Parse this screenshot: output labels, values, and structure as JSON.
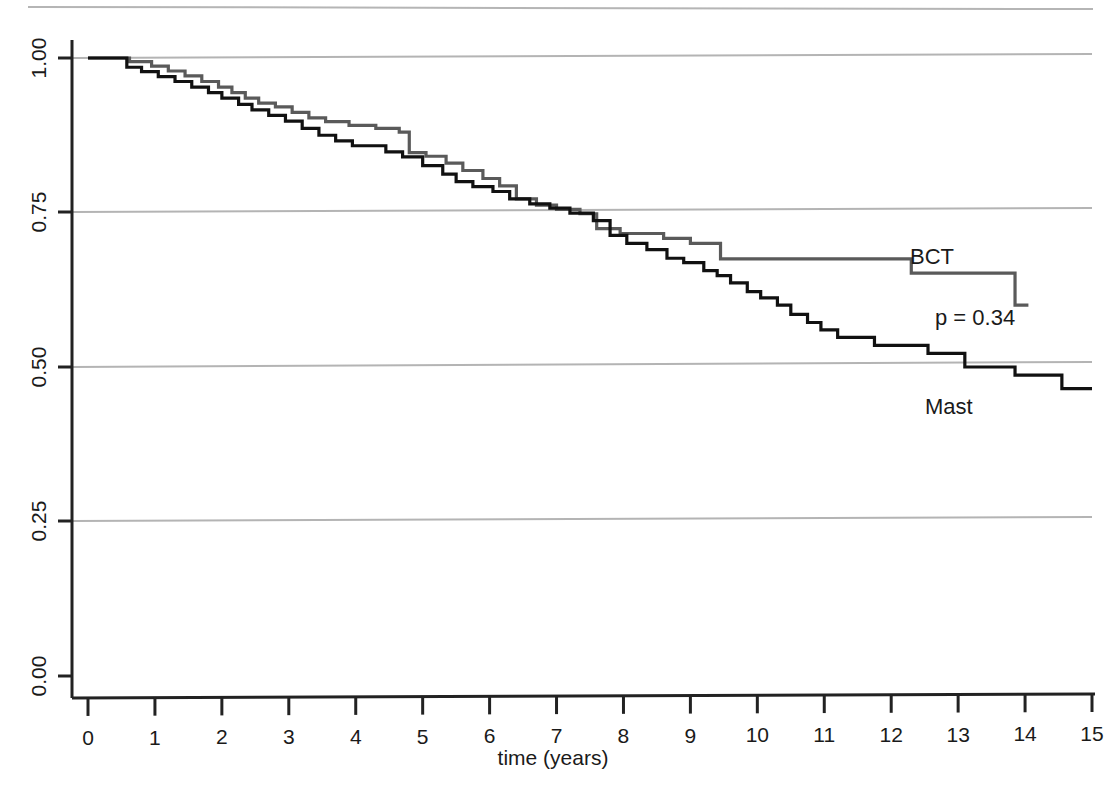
{
  "chart_data": {
    "type": "line",
    "subtype": "kaplan-meier-step",
    "title": "",
    "xlabel": "time (years)",
    "ylabel": "",
    "xlim": [
      0,
      15
    ],
    "ylim": [
      0,
      1
    ],
    "xticks": [
      0,
      1,
      2,
      3,
      4,
      5,
      6,
      7,
      8,
      9,
      10,
      11,
      12,
      13,
      14,
      15
    ],
    "xtick_labels": [
      "0",
      "1",
      "2",
      "3",
      "4",
      "5",
      "6",
      "7",
      "8",
      "9",
      "10",
      "11",
      "12",
      "13",
      "14",
      "15"
    ],
    "yticks": [
      0.0,
      0.25,
      0.5,
      0.75,
      1.0
    ],
    "ytick_labels": [
      "0.00",
      "0.25",
      "0.50",
      "0.75",
      "1.00"
    ],
    "ytick_labels_rotated": true,
    "grid": {
      "horizontal": true,
      "vertical": false,
      "color": "#b4b4b4"
    },
    "legend": {
      "position": "inline-annotations"
    },
    "annotations": [
      {
        "name": "p-value",
        "text": "p = 0.34",
        "x": 12.3,
        "y": 0.565
      },
      {
        "name": "bct-series-label",
        "text": "BCT",
        "x": 12.6,
        "y": 0.685
      },
      {
        "name": "mast-series-label",
        "text": "Mast",
        "x": 12.6,
        "y": 0.415
      }
    ],
    "series": [
      {
        "name": "BCT",
        "color": "#5a5a5a",
        "linewidth": 3.2,
        "points": [
          [
            0.0,
            1.0
          ],
          [
            0.62,
            1.0
          ],
          [
            0.62,
            0.994
          ],
          [
            0.95,
            0.994
          ],
          [
            0.95,
            0.987
          ],
          [
            1.2,
            0.987
          ],
          [
            1.2,
            0.979
          ],
          [
            1.45,
            0.979
          ],
          [
            1.45,
            0.971
          ],
          [
            1.7,
            0.971
          ],
          [
            1.7,
            0.962
          ],
          [
            1.95,
            0.962
          ],
          [
            1.95,
            0.953
          ],
          [
            2.15,
            0.953
          ],
          [
            2.15,
            0.944
          ],
          [
            2.35,
            0.944
          ],
          [
            2.35,
            0.935
          ],
          [
            2.55,
            0.935
          ],
          [
            2.55,
            0.927
          ],
          [
            2.8,
            0.927
          ],
          [
            2.8,
            0.921
          ],
          [
            3.05,
            0.921
          ],
          [
            3.05,
            0.912
          ],
          [
            3.3,
            0.912
          ],
          [
            3.3,
            0.903
          ],
          [
            3.55,
            0.903
          ],
          [
            3.55,
            0.897
          ],
          [
            3.9,
            0.897
          ],
          [
            3.9,
            0.891
          ],
          [
            4.3,
            0.891
          ],
          [
            4.3,
            0.886
          ],
          [
            4.65,
            0.886
          ],
          [
            4.65,
            0.88
          ],
          [
            4.8,
            0.88
          ],
          [
            4.8,
            0.847
          ],
          [
            5.05,
            0.847
          ],
          [
            5.05,
            0.841
          ],
          [
            5.35,
            0.841
          ],
          [
            5.35,
            0.83
          ],
          [
            5.6,
            0.83
          ],
          [
            5.6,
            0.818
          ],
          [
            5.9,
            0.818
          ],
          [
            5.9,
            0.805
          ],
          [
            6.15,
            0.805
          ],
          [
            6.15,
            0.793
          ],
          [
            6.4,
            0.793
          ],
          [
            6.4,
            0.772
          ],
          [
            6.7,
            0.772
          ],
          [
            6.7,
            0.762
          ],
          [
            7.0,
            0.762
          ],
          [
            7.0,
            0.755
          ],
          [
            7.35,
            0.755
          ],
          [
            7.35,
            0.748
          ],
          [
            7.6,
            0.748
          ],
          [
            7.6,
            0.724
          ],
          [
            7.95,
            0.724
          ],
          [
            7.95,
            0.716
          ],
          [
            8.6,
            0.716
          ],
          [
            8.6,
            0.708
          ],
          [
            9.0,
            0.708
          ],
          [
            9.0,
            0.7
          ],
          [
            9.45,
            0.7
          ],
          [
            9.45,
            0.675
          ],
          [
            12.3,
            0.675
          ],
          [
            12.3,
            0.652
          ],
          [
            13.85,
            0.652
          ],
          [
            13.85,
            0.6
          ],
          [
            14.05,
            0.6
          ]
        ]
      },
      {
        "name": "Mast",
        "color": "#111111",
        "linewidth": 3.2,
        "points": [
          [
            0.0,
            1.0
          ],
          [
            0.58,
            1.0
          ],
          [
            0.58,
            0.985
          ],
          [
            0.8,
            0.985
          ],
          [
            0.8,
            0.978
          ],
          [
            1.05,
            0.978
          ],
          [
            1.05,
            0.97
          ],
          [
            1.3,
            0.97
          ],
          [
            1.3,
            0.962
          ],
          [
            1.55,
            0.962
          ],
          [
            1.55,
            0.953
          ],
          [
            1.8,
            0.953
          ],
          [
            1.8,
            0.944
          ],
          [
            2.0,
            0.944
          ],
          [
            2.0,
            0.935
          ],
          [
            2.25,
            0.935
          ],
          [
            2.25,
            0.925
          ],
          [
            2.45,
            0.925
          ],
          [
            2.45,
            0.916
          ],
          [
            2.7,
            0.916
          ],
          [
            2.7,
            0.907
          ],
          [
            2.95,
            0.907
          ],
          [
            2.95,
            0.898
          ],
          [
            3.2,
            0.898
          ],
          [
            3.2,
            0.886
          ],
          [
            3.45,
            0.886
          ],
          [
            3.45,
            0.875
          ],
          [
            3.7,
            0.875
          ],
          [
            3.7,
            0.866
          ],
          [
            3.95,
            0.866
          ],
          [
            3.95,
            0.858
          ],
          [
            4.45,
            0.858
          ],
          [
            4.45,
            0.848
          ],
          [
            4.7,
            0.848
          ],
          [
            4.7,
            0.84
          ],
          [
            5.0,
            0.84
          ],
          [
            5.0,
            0.826
          ],
          [
            5.3,
            0.826
          ],
          [
            5.3,
            0.812
          ],
          [
            5.5,
            0.812
          ],
          [
            5.5,
            0.8
          ],
          [
            5.75,
            0.8
          ],
          [
            5.75,
            0.792
          ],
          [
            6.05,
            0.792
          ],
          [
            6.05,
            0.784
          ],
          [
            6.3,
            0.784
          ],
          [
            6.3,
            0.772
          ],
          [
            6.6,
            0.772
          ],
          [
            6.6,
            0.764
          ],
          [
            6.9,
            0.764
          ],
          [
            6.9,
            0.757
          ],
          [
            7.2,
            0.757
          ],
          [
            7.2,
            0.749
          ],
          [
            7.55,
            0.749
          ],
          [
            7.55,
            0.737
          ],
          [
            7.8,
            0.737
          ],
          [
            7.8,
            0.713
          ],
          [
            8.05,
            0.713
          ],
          [
            8.05,
            0.7
          ],
          [
            8.35,
            0.7
          ],
          [
            8.35,
            0.69
          ],
          [
            8.65,
            0.69
          ],
          [
            8.65,
            0.676
          ],
          [
            8.9,
            0.676
          ],
          [
            8.9,
            0.669
          ],
          [
            9.2,
            0.669
          ],
          [
            9.2,
            0.656
          ],
          [
            9.4,
            0.656
          ],
          [
            9.4,
            0.648
          ],
          [
            9.6,
            0.648
          ],
          [
            9.6,
            0.636
          ],
          [
            9.85,
            0.636
          ],
          [
            9.85,
            0.622
          ],
          [
            10.05,
            0.622
          ],
          [
            10.05,
            0.612
          ],
          [
            10.3,
            0.612
          ],
          [
            10.3,
            0.6
          ],
          [
            10.5,
            0.6
          ],
          [
            10.5,
            0.585
          ],
          [
            10.75,
            0.585
          ],
          [
            10.75,
            0.572
          ],
          [
            10.95,
            0.572
          ],
          [
            10.95,
            0.56
          ],
          [
            11.2,
            0.56
          ],
          [
            11.2,
            0.548
          ],
          [
            11.75,
            0.548
          ],
          [
            11.75,
            0.535
          ],
          [
            12.55,
            0.535
          ],
          [
            12.55,
            0.522
          ],
          [
            13.1,
            0.522
          ],
          [
            13.1,
            0.5
          ],
          [
            13.85,
            0.5
          ],
          [
            13.85,
            0.487
          ],
          [
            14.55,
            0.487
          ],
          [
            14.55,
            0.465
          ],
          [
            15.0,
            0.465
          ]
        ]
      }
    ]
  },
  "axes": {
    "x_axis_title": "time (years)",
    "y_tick_labels": [
      "1.00",
      "0.75",
      "0.50",
      "0.25",
      "0.00"
    ],
    "x_tick_labels": [
      "0",
      "1",
      "2",
      "3",
      "4",
      "5",
      "6",
      "7",
      "8",
      "9",
      "10",
      "11",
      "12",
      "13",
      "14",
      "15"
    ]
  },
  "labels": {
    "bct": "BCT",
    "mast": "Mast",
    "pvalue": "p = 0.34"
  },
  "colors": {
    "bct_line": "#5a5a5a",
    "mast_line": "#111111",
    "gridline": "#b4b4b4",
    "axis": "#222222",
    "text": "#1a1a1a",
    "background": "#ffffff"
  }
}
